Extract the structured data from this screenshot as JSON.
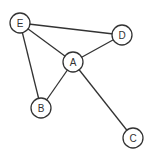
{
  "graph": {
    "node_radius": 10,
    "nodes": [
      {
        "id": "E",
        "label": "E",
        "x": 20,
        "y": 23
      },
      {
        "id": "D",
        "label": "D",
        "x": 122,
        "y": 35
      },
      {
        "id": "A",
        "label": "A",
        "x": 73,
        "y": 62
      },
      {
        "id": "B",
        "label": "B",
        "x": 41,
        "y": 108
      },
      {
        "id": "C",
        "label": "C",
        "x": 133,
        "y": 138
      }
    ],
    "edges": [
      {
        "from": "E",
        "to": "D"
      },
      {
        "from": "E",
        "to": "A"
      },
      {
        "from": "E",
        "to": "B"
      },
      {
        "from": "A",
        "to": "D"
      },
      {
        "from": "A",
        "to": "B"
      },
      {
        "from": "A",
        "to": "C"
      }
    ],
    "colors": {
      "stroke": "#333333",
      "fill": "#ffffff",
      "background": "#ffffff"
    }
  }
}
